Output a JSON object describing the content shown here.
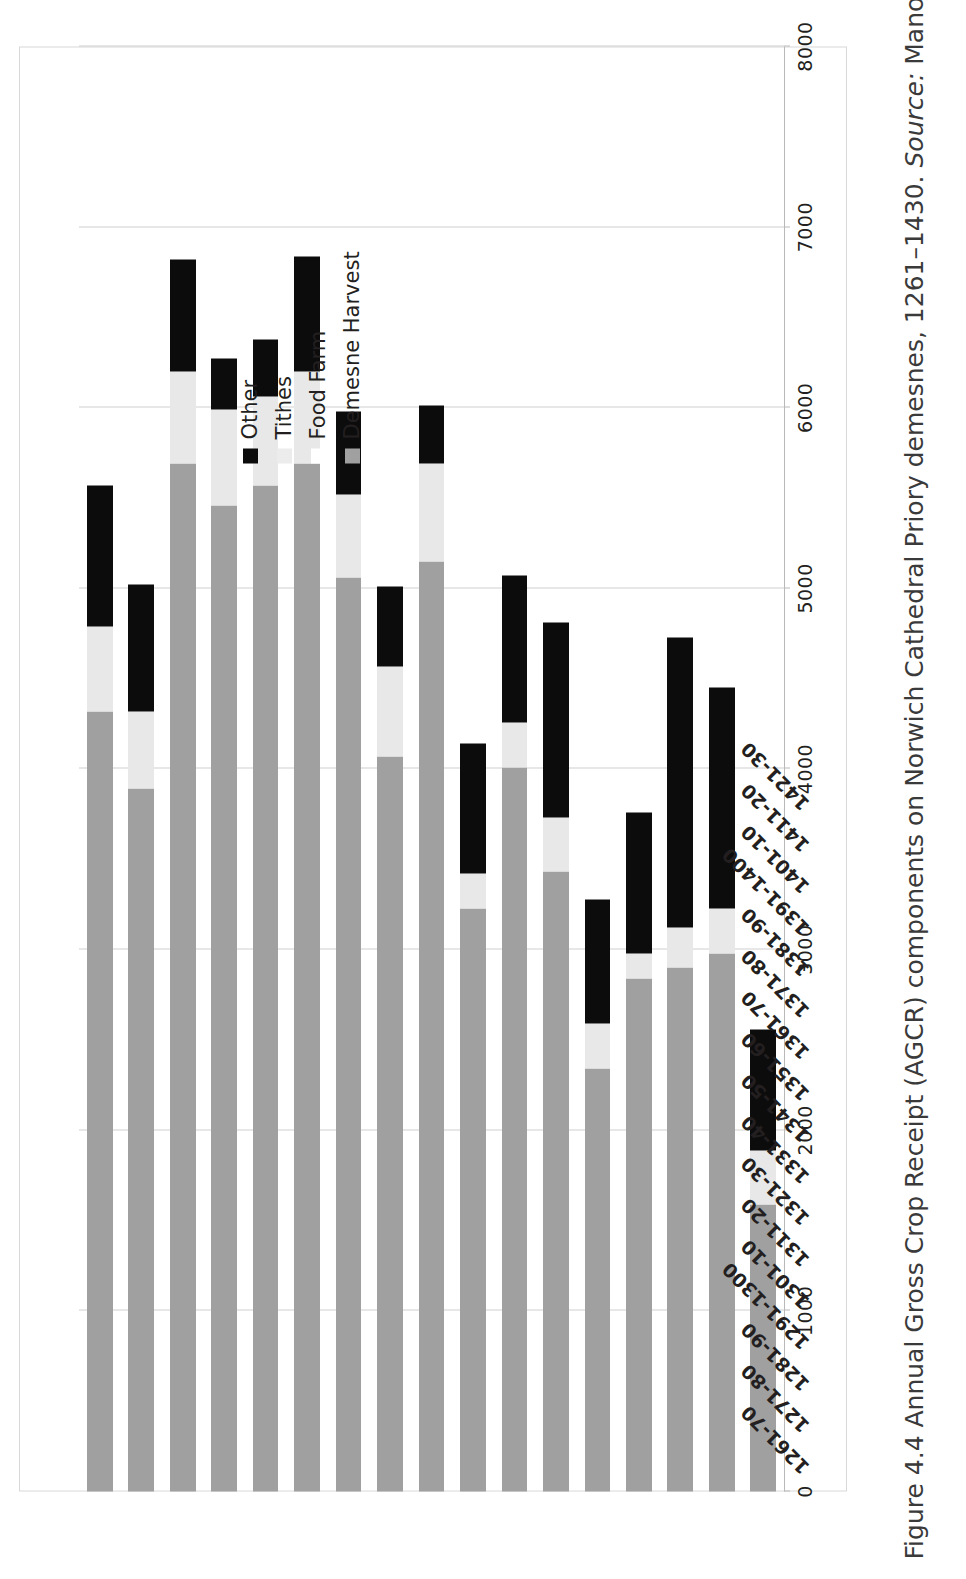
{
  "figure": {
    "caption_prefix": "Figure 4.4 Annual Gross Crop Receipt (AGCR) components on Norwich Cathedral Priory demesnes, 1261–1430.",
    "caption_source_label": "Source:",
    "caption_source_value": "Manorial accounts database."
  },
  "legend": {
    "position": "inside-plot-upper-right",
    "items": [
      {
        "label": "Other",
        "swatch": "other",
        "color": "#0c0c0c"
      },
      {
        "label": "Tithes",
        "swatch": "tithes",
        "color": "#ececec"
      },
      {
        "label": "Food Farm",
        "swatch": "foodfarm",
        "color": "#ffffff"
      },
      {
        "label": "Demesne Harvest",
        "swatch": "harvest",
        "color": "#a0a0a0"
      }
    ]
  },
  "axis": {
    "value_ticks": [
      "0",
      "1000",
      "2000",
      "3000",
      "4000",
      "5000",
      "6000",
      "7000",
      "8000"
    ],
    "value_min": 0,
    "value_max": 8000,
    "value_step": 1000,
    "grid": true
  },
  "chart_data": {
    "type": "bar",
    "orientation": "horizontal",
    "stacked": true,
    "title": "",
    "xlabel": "",
    "ylabel": "",
    "ylim": [
      0,
      8000
    ],
    "grid": true,
    "legend_position": "upper right",
    "categories": [
      "1261-70",
      "1271-80",
      "1281-90",
      "1291-1300",
      "1301-10",
      "1311-20",
      "1321-30",
      "1331-40",
      "1341-50",
      "1351-60",
      "1361-70",
      "1371-80",
      "1381-90",
      "1391-1400",
      "1401-10",
      "1411-20",
      "1421-30"
    ],
    "series": [
      {
        "name": "Demesne Harvest",
        "color": "#a0a0a0",
        "values": [
          4320,
          3890,
          5690,
          5460,
          5570,
          5690,
          5060,
          4070,
          5150,
          3230,
          4010,
          3430,
          2340,
          2840,
          2900,
          2980,
          1590
        ]
      },
      {
        "name": "Food Farm",
        "color": "#ffffff",
        "values": [
          0,
          0,
          0,
          0,
          0,
          0,
          0,
          0,
          0,
          0,
          0,
          0,
          0,
          0,
          0,
          0,
          0
        ]
      },
      {
        "name": "Tithes",
        "color": "#ececec",
        "values": [
          470,
          430,
          510,
          530,
          490,
          510,
          460,
          500,
          540,
          190,
          250,
          300,
          250,
          140,
          220,
          250,
          300
        ]
      },
      {
        "name": "Other",
        "color": "#0c0c0c",
        "values": [
          780,
          700,
          620,
          280,
          320,
          640,
          460,
          440,
          320,
          720,
          810,
          1080,
          690,
          780,
          1610,
          1220,
          670
        ]
      }
    ],
    "totals": [
      5570,
      5020,
      6820,
      6270,
      6380,
      6840,
      5980,
      5010,
      6010,
      4140,
      5070,
      4810,
      3280,
      3760,
      4730,
      4450,
      2560
    ]
  },
  "colors": {
    "harvest": "#a0a0a0",
    "food_farm": "#ffffff",
    "tithes": "#ececec",
    "other": "#0c0c0c",
    "gridline": "#cfcfcf",
    "frame": "#d8d8d8",
    "text": "#231f20"
  }
}
